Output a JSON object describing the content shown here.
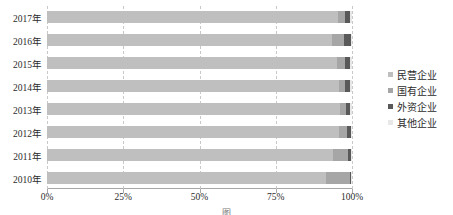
{
  "chart_data": {
    "type": "bar",
    "subtype": "stacked-100-horizontal",
    "title": "",
    "xlabel": "",
    "ylabel": "",
    "grid": true,
    "legend_position": "right",
    "xlim": [
      0,
      100
    ],
    "x_ticks": [
      "0%",
      "25%",
      "50%",
      "75%",
      "100%"
    ],
    "x_tick_values": [
      0,
      25,
      50,
      75,
      100
    ],
    "categories": [
      "2017年",
      "2016年",
      "2015年",
      "2014年",
      "2013年",
      "2012年",
      "2011年",
      "2010年"
    ],
    "series": [
      {
        "name": "民营企业",
        "color": "#bfbfbf",
        "values": [
          95.5,
          93.5,
          95.2,
          95.8,
          96.2,
          95.6,
          93.8,
          91.5
        ]
      },
      {
        "name": "国有企业",
        "color": "#a6a6a6",
        "values": [
          2.2,
          4.0,
          2.5,
          1.8,
          1.9,
          2.8,
          5.0,
          8.0
        ]
      },
      {
        "name": "外资企业",
        "color": "#595959",
        "values": [
          1.8,
          2.2,
          1.8,
          1.9,
          1.4,
          1.2,
          0.9,
          0.3
        ]
      },
      {
        "name": "其他企业",
        "color": "#e8e8e8",
        "values": [
          0.5,
          0.3,
          0.5,
          0.5,
          0.5,
          0.4,
          0.3,
          0.2
        ]
      }
    ]
  },
  "legend": {
    "items": [
      {
        "label": "民营企业",
        "color": "#bfbfbf"
      },
      {
        "label": "国有企业",
        "color": "#a6a6a6"
      },
      {
        "label": "外资企业",
        "color": "#595959"
      },
      {
        "label": "其他企业",
        "color": "#e8e8e8"
      }
    ]
  },
  "caption": {
    "text": "图"
  },
  "colors": {
    "axis": "#a6a6a6",
    "grid": "#c9c9c9",
    "text": "#2b2b2b",
    "background": "#ffffff"
  }
}
